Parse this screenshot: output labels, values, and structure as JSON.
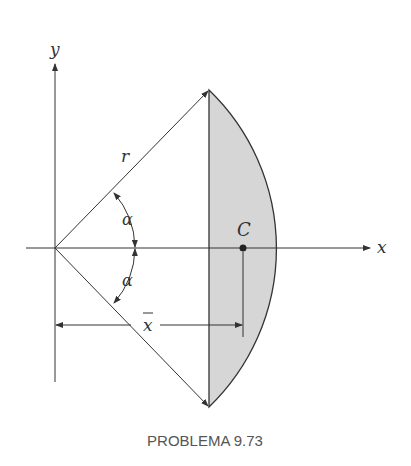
{
  "diagram": {
    "caption": "PROBLEMA 9.73",
    "labels": {
      "y_axis": "y",
      "x_axis": "x",
      "radius": "r",
      "angle_top": "α",
      "angle_bottom": "α",
      "centroid": "C",
      "x_bar": "x"
    },
    "colors": {
      "fill": "#d6d6d6",
      "line": "#333333"
    }
  }
}
